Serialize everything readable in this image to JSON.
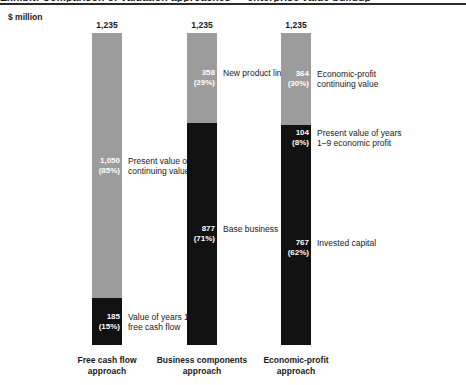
{
  "figure": {
    "clipped_title": "Exhibit: Comparison of valuation approaches — enterprise value buildup",
    "unit_label": "$ million"
  },
  "chart_data": {
    "type": "bar",
    "title": "",
    "subtitle": "",
    "xlabel": "",
    "ylabel": "$ million",
    "ylim": [
      0,
      1235
    ],
    "grid": false,
    "legend_position": "none",
    "stacked": true,
    "total_label": "1,235",
    "total_value": 1235,
    "categories": [
      "Free cash flow\napproach",
      "Business components\napproach",
      "Economic-profit\napproach"
    ],
    "bars": [
      {
        "category": "Free cash flow\napproach",
        "total": 1235,
        "total_label": "1,235",
        "segments": [
          {
            "label": "Present value of\ncontinuing value",
            "value": 1050,
            "value_label": "1,050",
            "pct": 85,
            "pct_label": "(85%)",
            "color": "#9c9c9c",
            "shade": "light"
          },
          {
            "label": "Value of years 1–9\nfree cash flow",
            "value": 185,
            "value_label": "185",
            "pct": 15,
            "pct_label": "(15%)",
            "color": "#111111",
            "shade": "dark"
          }
        ]
      },
      {
        "category": "Business components\napproach",
        "total": 1235,
        "total_label": "1,235",
        "segments": [
          {
            "label": "New product line",
            "value": 358,
            "value_label": "358",
            "pct": 29,
            "pct_label": "(29%)",
            "color": "#9c9c9c",
            "shade": "light"
          },
          {
            "label": "Base business",
            "value": 877,
            "value_label": "877",
            "pct": 71,
            "pct_label": "(71%)",
            "color": "#111111",
            "shade": "dark"
          }
        ]
      },
      {
        "category": "Economic-profit\napproach",
        "total": 1235,
        "total_label": "1,235",
        "segments": [
          {
            "label": "Economic-profit\ncontinuing value",
            "value": 364,
            "value_label": "364",
            "pct": 30,
            "pct_label": "(30%)",
            "color": "#9c9c9c",
            "shade": "light"
          },
          {
            "label": "Present value of years\n1–9 economic profit",
            "value": 104,
            "value_label": "104",
            "pct": 8,
            "pct_label": "(8%)",
            "color": "#111111",
            "shade": "dark"
          },
          {
            "label": "Invested capital",
            "value": 767,
            "value_label": "767",
            "pct": 62,
            "pct_label": "(62%)",
            "color": "#111111",
            "shade": "dark"
          }
        ]
      }
    ]
  }
}
